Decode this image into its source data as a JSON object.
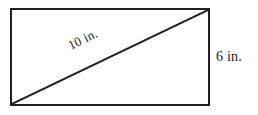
{
  "figure": {
    "type": "geometry-diagram",
    "shape": "rectangle",
    "stroke_color": "#231f20",
    "background_color": "#ffffff",
    "stroke_width_px": 2,
    "rectangle": {
      "left_px": 11,
      "top_px": 9,
      "right_px": 209,
      "bottom_px": 105,
      "width_px": 198,
      "height_px": 96
    },
    "diagonal": {
      "x1_px": 12,
      "y1_px": 104,
      "x2_px": 208,
      "y2_px": 10,
      "rotation_deg": -25.9
    },
    "labels": {
      "diagonal": {
        "text": "10 in.",
        "value": 10,
        "unit": "in.",
        "placement": "along-diagonal",
        "rotated": true
      },
      "height": {
        "text": "6 in.",
        "value": 6,
        "unit": "in.",
        "placement": "right-of-rectangle",
        "rotated": false
      }
    }
  }
}
